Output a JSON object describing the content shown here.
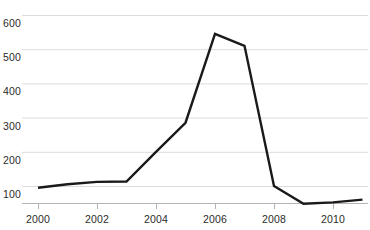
{
  "chart_data": {
    "type": "line",
    "title": "",
    "subtitle": "",
    "xlabel": "",
    "ylabel": "",
    "x": [
      2000,
      2001,
      2002,
      2003,
      2004,
      2005,
      2006,
      2007,
      2008,
      2009,
      2010,
      2011
    ],
    "values": [
      95,
      105,
      112,
      113,
      200,
      285,
      545,
      510,
      100,
      48,
      52,
      60
    ],
    "series": [
      {
        "name": "",
        "values": [
          95,
          105,
          112,
          113,
          200,
          285,
          545,
          510,
          100,
          48,
          52,
          60
        ]
      }
    ],
    "xlim": [
      1999,
      2011.5
    ],
    "ylim": [
      0,
      620
    ],
    "yticks": [
      100,
      200,
      300,
      400,
      500,
      600
    ],
    "ytick_labels": [
      "100",
      "200",
      "300",
      "400",
      "500",
      "600"
    ],
    "xticks": [
      2000,
      2002,
      2004,
      2006,
      2008,
      2010
    ],
    "xtick_labels": [
      "2000",
      "2002",
      "2004",
      "2006",
      "2008",
      "2010"
    ],
    "grid": true,
    "grid_axis": "y",
    "legend": false,
    "legend_position": "none",
    "colors": {
      "line": "#1a1a1a",
      "grid": "#dcdcdc",
      "axis": "#b4b4b4",
      "tick_mark": "#b4b4b4",
      "text": "#2b2b2b",
      "background": "#ffffff"
    },
    "line_width": 2.4
  }
}
